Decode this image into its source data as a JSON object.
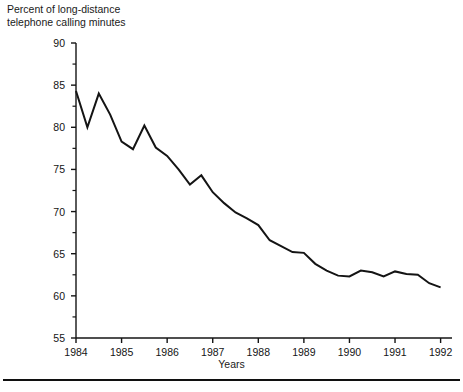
{
  "chart_data": {
    "type": "line",
    "title": "",
    "ylabel": "Percent of long-distance\ntelephone calling minutes",
    "xlabel": "Years",
    "ylim": [
      55,
      90
    ],
    "xlim": [
      1984,
      1992.25
    ],
    "y_ticks": [
      55,
      60,
      65,
      70,
      75,
      80,
      85,
      90
    ],
    "y_minor_ticks": [
      57.5,
      62.5,
      67.5,
      72.5,
      77.5,
      82.5,
      87.5
    ],
    "x_ticks": [
      1984,
      1985,
      1986,
      1987,
      1988,
      1989,
      1990,
      1991,
      1992
    ],
    "x_tick_labels": [
      "1984",
      "1985",
      "1986",
      "1987",
      "1988",
      "1989",
      "1990",
      "1991",
      "1992"
    ],
    "grid": false,
    "legend": false,
    "line_color": "#141414",
    "line_width": 2.0,
    "series": [
      {
        "name": "Percent of long-distance telephone calling minutes",
        "x": [
          1984.0,
          1984.25,
          1984.5,
          1984.75,
          1985.0,
          1985.25,
          1985.5,
          1985.75,
          1986.0,
          1986.25,
          1986.5,
          1986.75,
          1987.0,
          1987.25,
          1987.5,
          1987.75,
          1988.0,
          1988.25,
          1988.5,
          1988.75,
          1989.0,
          1989.25,
          1989.5,
          1989.75,
          1990.0,
          1990.25,
          1990.5,
          1990.75,
          1991.0,
          1991.25,
          1991.5,
          1991.75,
          1992.0
        ],
        "values": [
          84.3,
          80.0,
          84.0,
          81.5,
          78.3,
          77.4,
          80.2,
          77.6,
          76.6,
          75.0,
          73.2,
          74.3,
          72.3,
          71.0,
          69.9,
          69.2,
          68.4,
          66.6,
          65.9,
          65.2,
          65.1,
          63.8,
          63.0,
          62.4,
          62.3,
          63.0,
          62.8,
          62.3,
          62.9,
          62.6,
          62.5,
          61.5,
          61.0
        ]
      }
    ]
  }
}
